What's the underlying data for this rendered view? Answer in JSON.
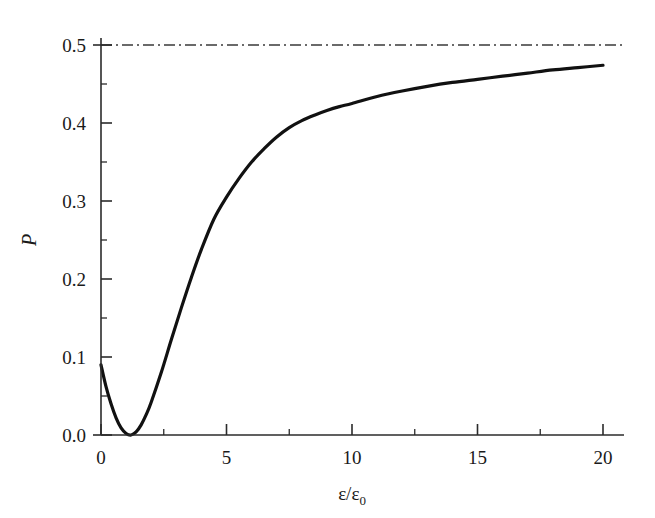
{
  "figure": {
    "background_color": "#ffffff",
    "curve_color": "#111111",
    "axis_color": "#2b2b2b",
    "asymptote_color": "#3a3a3a"
  },
  "axes": {
    "x_axis_label": "ε/ε₀",
    "x_axis_label_parts": {
      "numerator": "ε",
      "slash": "/",
      "denominator": "ε",
      "subscript": "0"
    },
    "y_axis_label": "P",
    "x_ticks": [
      "0",
      "5",
      "10",
      "15",
      "20"
    ],
    "y_ticks": [
      "0.0",
      "0.1",
      "0.2",
      "0.3",
      "0.4",
      "0.5"
    ]
  },
  "chart_data": {
    "type": "line",
    "title": "",
    "xlabel": "ε/ε₀",
    "ylabel": "P",
    "xlim": [
      0,
      21.2
    ],
    "ylim": [
      0.0,
      0.515
    ],
    "grid": false,
    "legend": null,
    "x_major_ticks": [
      0,
      5,
      10,
      15,
      20
    ],
    "y_major_ticks": [
      0.0,
      0.1,
      0.2,
      0.3,
      0.4,
      0.5
    ],
    "x_minor_ticks": [
      2.5,
      7.5,
      12.5,
      17.5
    ],
    "y_minor_ticks": [
      0.05,
      0.15,
      0.25,
      0.35,
      0.45
    ],
    "series": [
      {
        "name": "P",
        "style": "solid",
        "linewidth": 3.2,
        "x": [
          0.0,
          0.2,
          0.4,
          0.6,
          0.8,
          1.0,
          1.2,
          1.4,
          1.6,
          1.8,
          2.0,
          2.4,
          2.8,
          3.2,
          3.6,
          4.0,
          4.5,
          5.0,
          5.5,
          6.0,
          6.5,
          7.0,
          7.5,
          8.0,
          8.5,
          9.0,
          9.5,
          10.0,
          11.0,
          12.0,
          13.0,
          14.0,
          15.0,
          16.0,
          17.0,
          18.0,
          19.0,
          20.0
        ],
        "y": [
          0.09,
          0.062,
          0.04,
          0.022,
          0.009,
          0.002,
          0.0,
          0.004,
          0.013,
          0.026,
          0.042,
          0.08,
          0.122,
          0.163,
          0.202,
          0.238,
          0.277,
          0.305,
          0.329,
          0.35,
          0.367,
          0.382,
          0.394,
          0.403,
          0.41,
          0.416,
          0.421,
          0.425,
          0.434,
          0.441,
          0.447,
          0.452,
          0.456,
          0.46,
          0.464,
          0.468,
          0.471,
          0.474
        ]
      },
      {
        "name": "asymptote",
        "style": "dash-dot",
        "linewidth": 1.4,
        "constant_y": 0.5,
        "x": [
          0,
          21.2
        ],
        "y": [
          0.5,
          0.5
        ]
      }
    ]
  }
}
